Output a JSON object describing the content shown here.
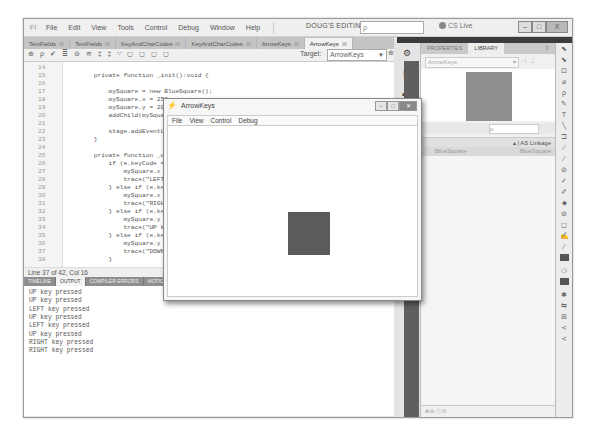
{
  "app": {
    "logo": "Fl",
    "menu": [
      "File",
      "Edit",
      "View",
      "Tools",
      "Control",
      "Debug",
      "Window",
      "Help"
    ],
    "workspace": "DOUG'S EDITING ▾",
    "search_placeholder": "ρ",
    "cs_live": "CS Live",
    "window_buttons": {
      "min": "–",
      "max": "□",
      "close": "X"
    }
  },
  "doc_tabs": [
    {
      "label": "TextFields",
      "active": false
    },
    {
      "label": "TextFields",
      "active": false
    },
    {
      "label": "KeyAndCharCodes",
      "active": false
    },
    {
      "label": "KeyAndCharCodes",
      "active": false
    },
    {
      "label": "ArrowKeys",
      "active": false
    },
    {
      "label": "ArrowKeys",
      "active": true
    }
  ],
  "toolbar": {
    "icons": "⊕ ρ ✔ ≣ ⊜ ≋ ‡ ‡ ∵ ◻ ◻ ◻ ◻",
    "target_label": "Target:",
    "target_value": "ArrowKeys"
  },
  "code": [
    {
      "n": "14",
      "t": ""
    },
    {
      "n": "15",
      "t": "        private function _init():void {"
    },
    {
      "n": "16",
      "t": ""
    },
    {
      "n": "17",
      "t": "            mySquare = new BlueSquare();"
    },
    {
      "n": "18",
      "t": "            mySquare.x = 250;"
    },
    {
      "n": "19",
      "t": "            mySquare.y = 200;"
    },
    {
      "n": "20",
      "t": "            addChild(mySquare);"
    },
    {
      "n": "21",
      "t": ""
    },
    {
      "n": "22",
      "t": "            stage.addEventListener"
    },
    {
      "n": "23",
      "t": "        }"
    },
    {
      "n": "24",
      "t": ""
    },
    {
      "n": "25",
      "t": "        private function _onKeyDown"
    },
    {
      "n": "26",
      "t": "            if (e.keyCode =="
    },
    {
      "n": "27",
      "t": "                mySquare.x -="
    },
    {
      "n": "28",
      "t": "                trace(\"LEFT"
    },
    {
      "n": "29",
      "t": "            } else if (e.keyCode"
    },
    {
      "n": "30",
      "t": "                mySquare.x +="
    },
    {
      "n": "31",
      "t": "                trace(\"RIGHT"
    },
    {
      "n": "32",
      "t": "            } else if (e.keyCode"
    },
    {
      "n": "33",
      "t": "                mySquare.y -="
    },
    {
      "n": "34",
      "t": "                trace(\"UP key"
    },
    {
      "n": "35",
      "t": "            } else if (e.keyCode"
    },
    {
      "n": "36",
      "t": "                mySquare.y +="
    },
    {
      "n": "37",
      "t": "                trace(\"DOWN"
    },
    {
      "n": "38",
      "t": "            }"
    }
  ],
  "status": "Line 37 of 42, Col 16",
  "output_tabs": [
    {
      "label": "TIMELINE",
      "active": false
    },
    {
      "label": "OUTPUT",
      "active": true
    },
    {
      "label": "COMPILER ERRORS",
      "active": false
    },
    {
      "label": "MOTION EDITOR",
      "active": false
    }
  ],
  "output_lines": [
    "UP key pressed",
    "UP key pressed",
    "LEFT key pressed",
    "UP key pressed",
    "LEFT key pressed",
    "UP key pressed",
    "RIGHT key pressed",
    "RIGHT key pressed"
  ],
  "panel": {
    "tabs": [
      {
        "label": "PROPERTIES",
        "active": false
      },
      {
        "label": "LIBRARY",
        "active": true
      }
    ],
    "menu_icon": "≡",
    "library_select": "ArrowKeys",
    "search_icon": "ρ",
    "col_linkage": "▴ | AS Linkage",
    "items": [
      {
        "name": "BlueSquare",
        "class": "BlueSquare"
      }
    ],
    "footer": "⊞ ⊟ ⓘ ⊡"
  },
  "swf_window": {
    "title": "ArrowKeys",
    "menu": [
      "File",
      "View",
      "Control",
      "Debug"
    ],
    "square_color": "#5b5b5b"
  },
  "tools": [
    "⬉",
    "⬊",
    "⊡",
    "⌀",
    "ρ",
    "✎",
    "T",
    "╲",
    "⊐",
    "∕",
    "∕",
    "⊘",
    "✓",
    "✐",
    "⬥",
    "⊘",
    "◻",
    "✍",
    "∕",
    "■",
    "⚆",
    "■",
    "✱",
    "⇆",
    "⊞",
    "≺",
    "≺"
  ]
}
